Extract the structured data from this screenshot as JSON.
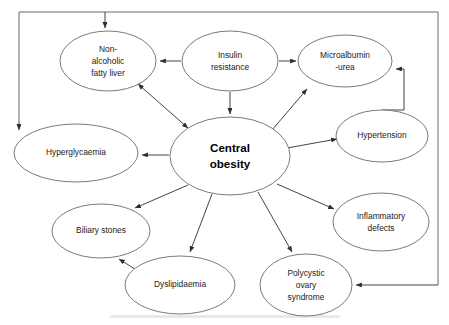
{
  "diagram": {
    "type": "node-link-concept-map",
    "background_color": "#ffffff",
    "node_stroke_color": "#6b6b6b",
    "edge_color": "#3a3a3a",
    "frame_color": "#5a5a5a",
    "nodes": [
      {
        "id": "central_obesity",
        "label_lines": [
          "Central",
          "obesity"
        ],
        "line1": "Central",
        "line2": "obesity",
        "emphasis": "bold",
        "cx": 230,
        "cy": 156,
        "rx": 60,
        "ry": 39
      },
      {
        "id": "nafl",
        "label_lines": [
          "Non-",
          "alcoholic",
          "fatty liver"
        ],
        "line1": "Non-",
        "line2": "alcoholic",
        "line3": "fatty liver",
        "cx": 108,
        "cy": 61,
        "rx": 48,
        "ry": 30
      },
      {
        "id": "insulin_resistance",
        "label_lines": [
          "Insulin",
          "resistance"
        ],
        "line1": "Insulin",
        "line2": "resistance",
        "cx": 230,
        "cy": 61,
        "rx": 48,
        "ry": 30
      },
      {
        "id": "microalbuminuria",
        "label_lines": [
          "Microalbumin",
          "-urea"
        ],
        "line1": "Microalbumin",
        "line2": "-urea",
        "cx": 345,
        "cy": 61,
        "rx": 47,
        "ry": 26
      },
      {
        "id": "hypertension",
        "label_lines": [
          "Hypertension"
        ],
        "line1": "Hypertension",
        "cx": 382,
        "cy": 136,
        "rx": 46,
        "ry": 26
      },
      {
        "id": "hyperglycaemia",
        "label_lines": [
          "Hyperglycaemia"
        ],
        "line1": "Hyperglycaemia",
        "cx": 76,
        "cy": 153,
        "rx": 62,
        "ry": 29
      },
      {
        "id": "inflammatory_defects",
        "label_lines": [
          "Inflammatory",
          "defects"
        ],
        "line1": "Inflammatory",
        "line2": "defects",
        "cx": 381,
        "cy": 222,
        "rx": 48,
        "ry": 29
      },
      {
        "id": "biliary_stones",
        "label_lines": [
          "Biliary stones"
        ],
        "line1": "Biliary stones",
        "cx": 101,
        "cy": 231,
        "rx": 49,
        "ry": 27
      },
      {
        "id": "dyslipidaemia",
        "label_lines": [
          "Dyslipidaemia"
        ],
        "line1": "Dyslipidaemia",
        "cx": 180,
        "cy": 285,
        "rx": 55,
        "ry": 29
      },
      {
        "id": "polycystic_ovary_syndrome",
        "label_lines": [
          "Polycystic",
          "ovary",
          "syndrome"
        ],
        "line1": "Polycystic",
        "line2": "ovary",
        "line3": "syndrome",
        "cx": 306,
        "cy": 285,
        "rx": 46,
        "ry": 31
      }
    ],
    "edges": [
      {
        "id": "e_frame_to_nafl",
        "from": "frame_top",
        "to": "nafl",
        "arrow": "single"
      },
      {
        "id": "e_frame_to_hyperglycaemia",
        "from": "frame_left",
        "to": "hyperglycaemia",
        "arrow": "single"
      },
      {
        "id": "e_insulin_to_nafl",
        "from": "insulin_resistance",
        "to": "nafl",
        "arrow": "single"
      },
      {
        "id": "e_insulin_to_microalbuminuria",
        "from": "insulin_resistance",
        "to": "microalbuminuria",
        "arrow": "single"
      },
      {
        "id": "e_insulin_to_central",
        "from": "insulin_resistance",
        "to": "central_obesity",
        "arrow": "single"
      },
      {
        "id": "e_nafl_central",
        "from": "nafl",
        "to": "central_obesity",
        "arrow": "double"
      },
      {
        "id": "e_central_to_hyperglycaemia",
        "from": "central_obesity",
        "to": "hyperglycaemia",
        "arrow": "single"
      },
      {
        "id": "e_central_to_microalbuminuria",
        "from": "central_obesity",
        "to": "microalbuminuria",
        "arrow": "single"
      },
      {
        "id": "e_central_to_hypertension",
        "from": "central_obesity",
        "to": "hypertension",
        "arrow": "single"
      },
      {
        "id": "e_central_to_inflammatory",
        "from": "central_obesity",
        "to": "inflammatory_defects",
        "arrow": "single"
      },
      {
        "id": "e_central_to_biliary",
        "from": "central_obesity",
        "to": "biliary_stones",
        "arrow": "single"
      },
      {
        "id": "e_central_to_dyslipidaemia",
        "from": "central_obesity",
        "to": "dyslipidaemia",
        "arrow": "single"
      },
      {
        "id": "e_central_to_pcos",
        "from": "central_obesity",
        "to": "polycystic_ovary_syndrome",
        "arrow": "single"
      },
      {
        "id": "e_dyslipidaemia_to_biliary",
        "from": "dyslipidaemia",
        "to": "biliary_stones",
        "arrow": "single"
      },
      {
        "id": "e_hypertension_to_microalbuminuria",
        "from": "hypertension",
        "to": "microalbuminuria",
        "arrow": "single"
      },
      {
        "id": "e_frame_right_to_pcos",
        "from": "frame_right",
        "to": "polycystic_ovary_syndrome",
        "arrow": "single"
      }
    ]
  }
}
